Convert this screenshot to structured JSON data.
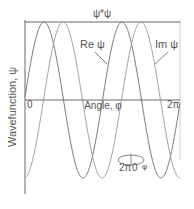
{
  "chart_data": {
    "type": "line",
    "title": "",
    "xlabel": "Angle, φ",
    "ylabel": "Wavefunction, ψ",
    "x_ticks": [
      "0",
      "2π"
    ],
    "xlim": [
      0,
      6.2832
    ],
    "ylim": [
      -1,
      1
    ],
    "grid": false,
    "legend_position": "inline annotations",
    "series": [
      {
        "name": "Re ψ",
        "function": "cos(2φ)",
        "x": [
          0,
          0.785,
          1.571,
          2.356,
          3.142,
          3.927,
          4.712,
          5.498,
          6.283
        ],
        "values": [
          1,
          0,
          -1,
          0,
          1,
          0,
          -1,
          0,
          1
        ],
        "color": "#777777"
      },
      {
        "name": "Im ψ",
        "function": "sin(2φ)",
        "x": [
          0,
          0.785,
          1.571,
          2.356,
          3.142,
          3.927,
          4.712,
          5.498,
          6.283
        ],
        "values": [
          0,
          1,
          0,
          -1,
          0,
          1,
          0,
          -1,
          0
        ],
        "color": "#9a9a9a"
      },
      {
        "name": "ψ*ψ",
        "function": "constant",
        "x": [
          0,
          6.283
        ],
        "values": [
          1,
          1
        ],
        "color": "#555555"
      }
    ],
    "annotations": [
      "ψ*ψ",
      "Re ψ",
      "Im ψ",
      "2π 0 φ (ring inset)"
    ]
  },
  "labels": {
    "psi_star_psi": "ψ*ψ",
    "re_psi": "Re ψ",
    "im_psi": "Im ψ",
    "x_zero": "0",
    "x_two_pi": "2π",
    "x_axis_label": "Angle, φ",
    "y_axis_label": "Wavefunction, ψ",
    "inset_two_pi": "2π",
    "inset_zero": "0",
    "inset_phi": "φ"
  },
  "colors": {
    "axis": "#555555",
    "re_curve": "#777777",
    "im_curve": "#a0a0a0",
    "right_axis": "#cccccc"
  }
}
